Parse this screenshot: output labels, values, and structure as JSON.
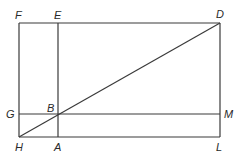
{
  "diagram": {
    "type": "geometric-figure",
    "points": {
      "F": {
        "label": "F",
        "x": 19,
        "y": 23
      },
      "E": {
        "label": "E",
        "x": 58,
        "y": 23
      },
      "D": {
        "label": "D",
        "x": 220,
        "y": 23
      },
      "G": {
        "label": "G",
        "x": 19,
        "y": 114
      },
      "B": {
        "label": "B",
        "x": 58,
        "y": 114
      },
      "M": {
        "label": "M",
        "x": 220,
        "y": 114
      },
      "H": {
        "label": "H",
        "x": 19,
        "y": 137
      },
      "A": {
        "label": "A",
        "x": 58,
        "y": 137
      },
      "L": {
        "label": "L",
        "x": 220,
        "y": 137
      }
    },
    "segments": [
      {
        "name": "FD",
        "from": "F",
        "to": "D"
      },
      {
        "name": "DL",
        "from": "D",
        "to": "L"
      },
      {
        "name": "LH",
        "from": "L",
        "to": "H"
      },
      {
        "name": "HF",
        "from": "H",
        "to": "F"
      },
      {
        "name": "EA",
        "from": "E",
        "to": "A"
      },
      {
        "name": "GM",
        "from": "G",
        "to": "M"
      },
      {
        "name": "HD",
        "from": "H",
        "to": "D"
      }
    ],
    "colors": {
      "line": "#3a3a3a",
      "label": "#2a2a2a",
      "background": "#ffffff"
    }
  }
}
